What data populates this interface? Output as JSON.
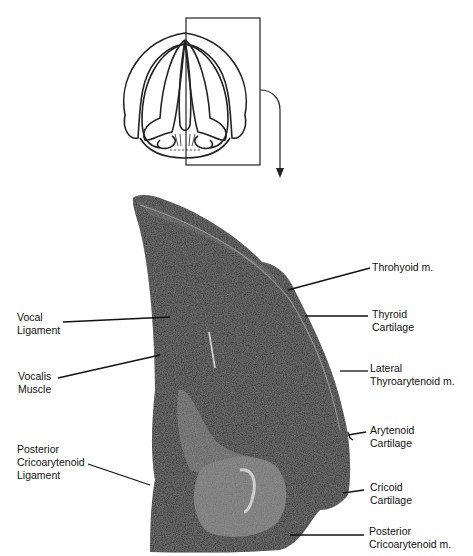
{
  "figure": {
    "inset": {
      "description": "Superior view schematic of larynx with boxed region",
      "box_label": ""
    },
    "labels": [
      {
        "id": "throhyoid",
        "text": "Throhyoid m."
      },
      {
        "id": "thyroid-cartilage",
        "text": "Thyroid\nCartilage"
      },
      {
        "id": "lateral-thyroarytenoid",
        "text": "Lateral\nThyroarytenoid m."
      },
      {
        "id": "arytenoid-cartilage",
        "text": "Arytenoid\nCartilage"
      },
      {
        "id": "cricoid-cartilage",
        "text": "Cricoid\nCartilage"
      },
      {
        "id": "posterior-cricoarytenoid-m",
        "text": "Posterior\nCricoarytenoid m."
      },
      {
        "id": "vocal-ligament",
        "text": "Vocal\nLigament"
      },
      {
        "id": "vocalis-muscle",
        "text": "Vocalis\nMuscle"
      },
      {
        "id": "posterior-cricoarytenoid-ligament",
        "text": "Posterior\nCricoarytenoid\nLigament"
      }
    ],
    "colors": {
      "tissue_dark": "#1c1c1c",
      "tissue_mid": "#4a4a4a",
      "cartilage_gray": "#6e6e6e",
      "line": "#111111"
    }
  }
}
